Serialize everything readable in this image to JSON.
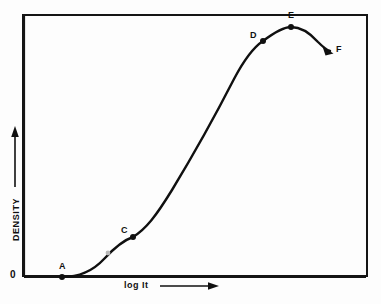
{
  "figure": {
    "origin_label": "0",
    "background_color": "#fdfdfd",
    "ink_color": "#101010",
    "frame": {
      "x": 22,
      "y": 14,
      "width": 346,
      "height": 263
    }
  },
  "axes": {
    "x": {
      "label": "log It",
      "arrow": "right-arrow-icon",
      "baseline_y": 277,
      "label_x": 124,
      "label_y": 281
    },
    "y": {
      "label": "DENSITY",
      "arrow": "up-arrow-icon",
      "axis_x": 24,
      "label_x": 15,
      "label_y": 230
    }
  },
  "chart_data": {
    "type": "line",
    "xlabel": "log It",
    "ylabel": "DENSITY",
    "grid": false,
    "legend": "none",
    "axis_ticks": "none",
    "x": [
      0.0,
      0.08,
      0.15,
      0.22,
      0.28,
      0.32,
      0.36,
      0.41,
      0.47,
      0.55,
      0.63,
      0.7,
      0.76,
      0.82,
      0.86,
      0.89,
      0.92,
      0.95,
      0.97,
      1.0
    ],
    "y": [
      0.0,
      0.0,
      0.02,
      0.07,
      0.13,
      0.17,
      0.22,
      0.31,
      0.44,
      0.59,
      0.74,
      0.84,
      0.9,
      0.94,
      0.96,
      0.95,
      0.93,
      0.89,
      0.86,
      0.83
    ],
    "xlim": [
      0,
      1
    ],
    "ylim": [
      0,
      1
    ],
    "annotations": [
      {
        "label": "A",
        "x": 0.115,
        "y": 0.0,
        "px": 62,
        "py": 277,
        "label_px": 59,
        "label_py": 262,
        "role": "threshold",
        "marker": "filled-dot",
        "marker_visible": true
      },
      {
        "label": "B",
        "x": 0.245,
        "y": 0.09,
        "px": 108,
        "py": 253,
        "label_px": 99,
        "label_py": 240,
        "role": "toe",
        "marker": "filled-dot",
        "marker_visible": false
      },
      {
        "label": "C",
        "x": 0.32,
        "y": 0.153,
        "px": 133,
        "py": 237,
        "label_px": 121,
        "label_py": 226,
        "role": "end-of-toe",
        "marker": "filled-dot",
        "marker_visible": true
      },
      {
        "label": "D",
        "x": 0.695,
        "y": 0.898,
        "px": 263,
        "py": 41,
        "label_px": 250,
        "label_py": 31,
        "role": "start-of-shoulder",
        "marker": "filled-dot",
        "marker_visible": true
      },
      {
        "label": "E",
        "x": 0.778,
        "y": 0.952,
        "px": 291,
        "py": 27,
        "label_px": 288,
        "label_py": 11,
        "role": "maximum-density",
        "marker": "filled-dot",
        "marker_visible": true
      },
      {
        "label": "F",
        "x": 0.89,
        "y": 0.86,
        "px": 330,
        "py": 51,
        "label_px": 336,
        "label_py": 45,
        "role": "reversal-solarization",
        "marker": "arrow-head",
        "marker_visible": true
      }
    ],
    "curve_path": "M 62 277 C 78 277, 92 272, 104 259 C 116 246, 124 240, 133 237 C 146 229, 156 216, 172 190 C 192 157, 214 118, 234 79 C 244 60, 254 47, 263 41 C 275 32, 284 27, 291 27 C 300 27, 310 33, 318 42 C 323 47, 327 50, 330 51"
  }
}
